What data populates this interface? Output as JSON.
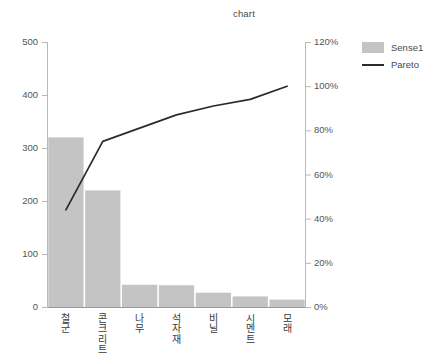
{
  "chart_data": {
    "type": "bar",
    "title": "chart",
    "xlabel": "",
    "ylabel": "",
    "grid": false,
    "legend_position": "right",
    "categories": [
      "철군",
      "콘크리트",
      "나무",
      "석자재",
      "비닐",
      "시멘트",
      "모래"
    ],
    "series": [
      {
        "name": "Sense1",
        "type": "bar",
        "axis": "left",
        "color": "#c4c4c4",
        "values": [
          320,
          220,
          42,
          41,
          27,
          20,
          14
        ]
      },
      {
        "name": "Pareto",
        "type": "line",
        "axis": "right",
        "color": "#2b2b2b",
        "values": [
          44,
          75,
          81,
          87,
          91,
          94,
          100
        ]
      }
    ],
    "left_axis": {
      "min": 0,
      "max": 500,
      "step": 100,
      "ticks": [
        "0",
        "100",
        "200",
        "300",
        "400",
        "500"
      ]
    },
    "right_axis": {
      "min": 0,
      "max": 120,
      "step": 20,
      "ticks": [
        "0%",
        "20%",
        "40%",
        "60%",
        "80%",
        "100%",
        "120%"
      ]
    }
  },
  "legend": {
    "items": [
      {
        "label": "Sense1",
        "key": "swatch"
      },
      {
        "label": "Pareto",
        "key": "line"
      }
    ]
  }
}
